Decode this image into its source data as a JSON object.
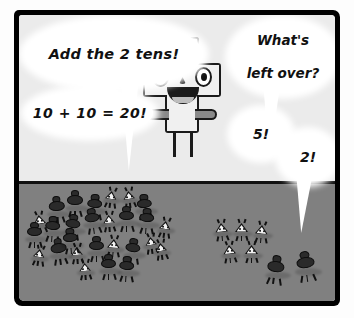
{
  "panel": {
    "kind": "comic-panel",
    "colors": {
      "frame": "#000000",
      "sky": "#ebebeb",
      "ground": "#808080",
      "bubble": "#ffffff",
      "ink": "#111111",
      "creature_dark": "#2a2a2a",
      "creature_light": "#f2f2f2"
    },
    "scene": {
      "horizon_y": 166,
      "character": {
        "name": "plus-sign-character",
        "expression": "smiling",
        "symbol": "+"
      }
    }
  },
  "bubbles": [
    {
      "id": "b1",
      "text": "Add the 2 tens!",
      "speaker": "offscreen-left",
      "tail": true
    },
    {
      "id": "b2",
      "line1": "What's",
      "line2": "left over?",
      "speaker": "offscreen-right",
      "tail": true
    },
    {
      "id": "b3",
      "text": "10 + 10 = 20!",
      "speaker": "offscreen-left",
      "tail": false
    },
    {
      "id": "b4",
      "text": "5!",
      "speaker": "offscreen-right",
      "tail": true
    },
    {
      "id": "b5",
      "text": "2!",
      "speaker": "offscreen-right",
      "tail": false
    }
  ],
  "groups": {
    "left_swarm": {
      "label": "grouped-tens-swarm",
      "count": 20
    },
    "right_light": {
      "label": "leftover-light-creatures",
      "count": 5
    },
    "right_dark": {
      "label": "leftover-dark-creatures",
      "count": 2
    }
  },
  "math": {
    "tens": 2,
    "sum": 20,
    "remainder_light": 5,
    "remainder_dark": 2
  }
}
